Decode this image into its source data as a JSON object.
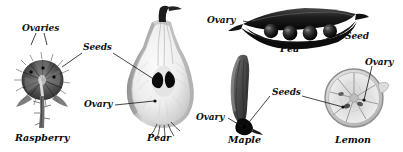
{
  "figure": {
    "background": "#ffffff",
    "ink": "#141414"
  },
  "specimens": [
    {
      "id": "raspberry",
      "caption": "Raspberry",
      "labels": [
        "Ovaries",
        "Seeds"
      ]
    },
    {
      "id": "pear",
      "caption": "Pear",
      "labels": [
        "Seeds",
        "Ovary"
      ]
    },
    {
      "id": "pea",
      "caption": "Pea",
      "labels": [
        "Ovary",
        "Seed"
      ]
    },
    {
      "id": "maple",
      "caption": "Maple",
      "labels": [
        "Ovary",
        "Seeds"
      ]
    },
    {
      "id": "lemon",
      "caption": "Lemon",
      "labels": [
        "Ovary",
        "Seeds"
      ]
    }
  ],
  "labels": {
    "ovaries_raspberry": "Ovaries",
    "seeds_raspberry_pear": "Seeds",
    "ovary_pear": "Ovary",
    "ovary_pea": "Ovary",
    "seed_pea": "Seed",
    "ovary_maple": "Ovary",
    "seeds_maple_lemon": "Seeds",
    "ovary_lemon": "Ovary"
  },
  "captions": {
    "raspberry": "Raspberry",
    "pear": "Pear",
    "pea": "Pea",
    "maple": "Maple",
    "lemon": "Lemon"
  }
}
